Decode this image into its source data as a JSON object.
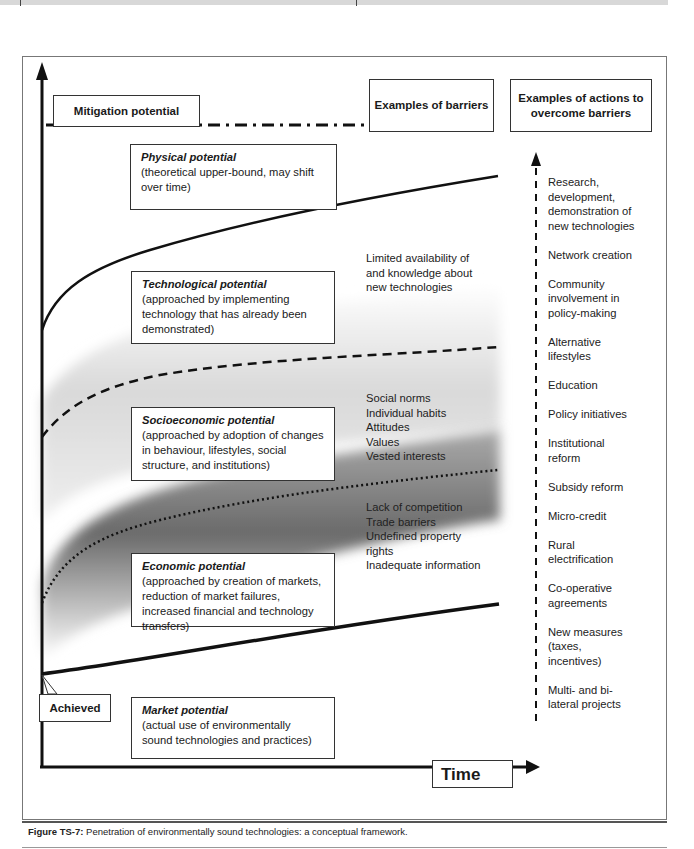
{
  "headers": {
    "y_axis": "Mitigation potential",
    "barriers": "Examples of barriers",
    "actions": "Examples of actions to overcome barriers",
    "x_axis": "Time",
    "achieved": "Achieved"
  },
  "potentials": [
    {
      "title": "Physical potential",
      "desc": "(theoretical upper-bound, may shift over time)"
    },
    {
      "title": "Technological potential",
      "desc": "(approached by implementing technology that has already been demonstrated)"
    },
    {
      "title": "Socioeconomic potential",
      "desc": "(approached by adoption of changes in behaviour, lifestyles, social structure, and institutions)"
    },
    {
      "title": "Economic potential",
      "desc": "(approached by creation of markets, reduction of market failures, increased financial and technology transfers)"
    },
    {
      "title": "Market potential",
      "desc": "(actual use of environmentally sound technologies and practices)"
    }
  ],
  "barriers": {
    "technological": "Limited availability of and knowledge about new technologies",
    "socioeconomic": [
      "Social norms",
      "Individual habits",
      "Attitudes",
      "Values",
      "Vested interests"
    ],
    "economic": [
      "Lack of competition",
      "Trade barriers",
      "Undefined property rights",
      "Inadequate information"
    ]
  },
  "actions": [
    "Research, development, demonstration of new technologies",
    "Network creation",
    "Community involvement in policy-making",
    "Alternative lifestyles",
    "Education",
    "Policy initiatives",
    "Institutional reform",
    "Subsidy reform",
    "Micro-credit",
    "Rural electrification",
    "Co-operative agreements",
    "New measures (taxes, incentives)",
    "Multi- and bi-lateral projects"
  ],
  "caption": {
    "label": "Figure TS-7:",
    "text": " Penetration of environmentally sound technologies: a conceptual framework."
  }
}
